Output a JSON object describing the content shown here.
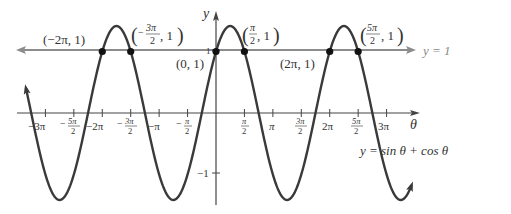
{
  "chart_data": {
    "type": "line",
    "title": "",
    "function": "y = sin θ + cos θ",
    "xlabel": "θ",
    "ylabel": "y",
    "xlim_radians": [
      -11.2,
      10.9
    ],
    "ylim": [
      -1.5,
      1.6
    ],
    "x_ticks": [
      {
        "value": -9.4248,
        "label": "−3π"
      },
      {
        "value": -7.854,
        "label": "−5π/2"
      },
      {
        "value": -6.2832,
        "label": "−2π"
      },
      {
        "value": -4.7124,
        "label": "−3π/2"
      },
      {
        "value": -3.1416,
        "label": "−π"
      },
      {
        "value": -1.5708,
        "label": "−π/2"
      },
      {
        "value": 1.5708,
        "label": "π/2"
      },
      {
        "value": 3.1416,
        "label": "π"
      },
      {
        "value": 4.7124,
        "label": "3π/2"
      },
      {
        "value": 6.2832,
        "label": "2π"
      },
      {
        "value": 7.854,
        "label": "5π/2"
      },
      {
        "value": 9.4248,
        "label": "3π"
      }
    ],
    "y_ticks": [
      {
        "value": 1,
        "label": "1"
      },
      {
        "value": -1,
        "label": "−1"
      }
    ],
    "series": [
      {
        "name": "y = sin θ + cos θ",
        "color": "#3a3a3a",
        "x_range": [
          -10.5,
          10.8
        ]
      },
      {
        "name": "y = 1",
        "color": "#888888",
        "constant": 1
      }
    ],
    "points": [
      {
        "x": -6.2832,
        "y": 1,
        "label": "(−2π, 1)"
      },
      {
        "x": -4.7124,
        "y": 1,
        "label": "(−3π/2, 1)"
      },
      {
        "x": 0,
        "y": 1,
        "label": "(0, 1)"
      },
      {
        "x": 1.5708,
        "y": 1,
        "label": "(π/2, 1)"
      },
      {
        "x": 6.2832,
        "y": 1,
        "label": "(2π, 1)"
      },
      {
        "x": 7.854,
        "y": 1,
        "label": "(5π/2, 1)"
      }
    ],
    "grid": false,
    "legend": "none (curve labels inline)"
  },
  "labels": {
    "y_axis": "y",
    "x_axis": "θ",
    "line_label": "y = 1",
    "curve_label": "y = sin θ + cos θ",
    "pt_neg2pi": "(−2π, 1)",
    "pt_origin": "(0, 1)",
    "pt_2pi": "(2π, 1)",
    "one": "1",
    "neg_one": "−1",
    "num_3pi": "3π",
    "num_pi": "π",
    "num_5pi": "5π",
    "den_2": "2",
    "minus": "−",
    "comma_one": ", 1",
    "t_neg3pi": "−3π",
    "t_neg2pi": "−2π",
    "t_negpi": "−π",
    "t_pi": "π",
    "t_2pi": "2π",
    "t_3pi": "3π"
  }
}
